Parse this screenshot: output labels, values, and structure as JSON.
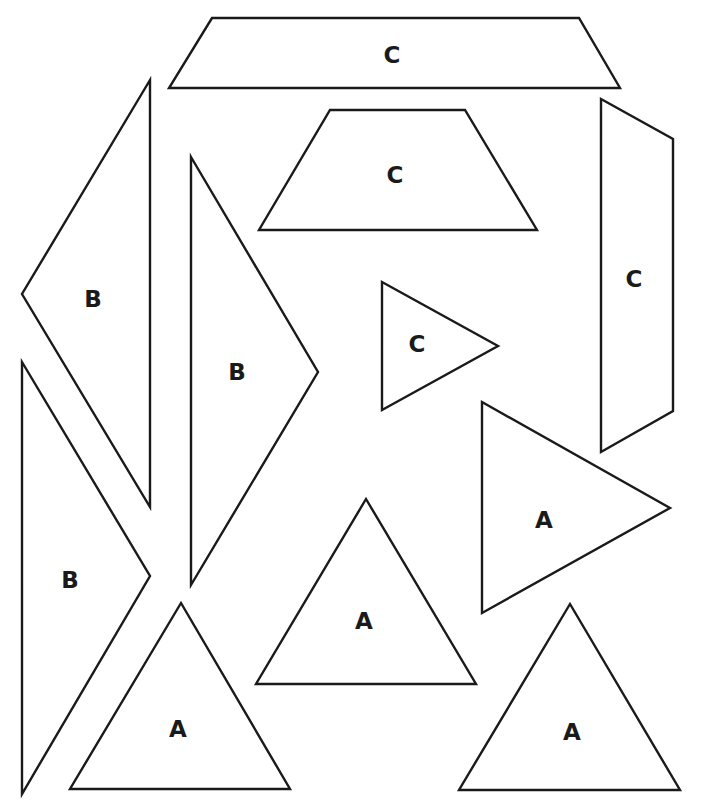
{
  "canvas": {
    "width": 702,
    "height": 811,
    "background": "#ffffff",
    "stroke_color": "#1a1a1a"
  },
  "shapes": [
    {
      "id": "c1",
      "label": "C",
      "kind": "trapezoid",
      "points": "212,18 579,18 620,88 169,88",
      "label_pos": [
        392,
        55
      ]
    },
    {
      "id": "c2",
      "label": "C",
      "kind": "trapezoid",
      "points": "330,110 465,110 537,230 259,230",
      "label_pos": [
        395,
        175
      ]
    },
    {
      "id": "c3",
      "label": "C",
      "kind": "quadrilateral",
      "points": "601,99 673,139 673,411 601,452",
      "label_pos": [
        634,
        279
      ]
    },
    {
      "id": "c4",
      "label": "C",
      "kind": "triangle",
      "points": "382,282 498,346 382,410",
      "label_pos": [
        417,
        344
      ]
    },
    {
      "id": "b1",
      "label": "B",
      "kind": "triangle",
      "points": "150,80 150,507 22,294",
      "label_pos": [
        93,
        299
      ]
    },
    {
      "id": "b2",
      "label": "B",
      "kind": "triangle",
      "points": "191,157 318,372 191,585",
      "label_pos": [
        237,
        372
      ]
    },
    {
      "id": "b3",
      "label": "B",
      "kind": "triangle",
      "points": "22,362 150,576 22,794",
      "label_pos": [
        70,
        580
      ]
    },
    {
      "id": "a1",
      "label": "A",
      "kind": "triangle",
      "points": "482,402 670,508 482,613",
      "label_pos": [
        544,
        520
      ]
    },
    {
      "id": "a2",
      "label": "A",
      "kind": "triangle",
      "points": "366,499 476,684 256,684",
      "label_pos": [
        364,
        621
      ]
    },
    {
      "id": "a3",
      "label": "A",
      "kind": "triangle",
      "points": "181,603 290,789 70,789",
      "label_pos": [
        178,
        729
      ]
    },
    {
      "id": "a4",
      "label": "A",
      "kind": "triangle",
      "points": "570,604 680,790 459,790",
      "label_pos": [
        572,
        732
      ]
    }
  ]
}
